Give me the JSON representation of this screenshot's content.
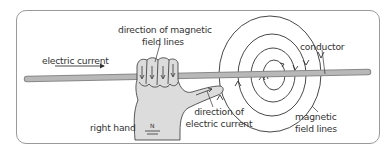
{
  "diagram": {
    "labels": {
      "electric_current": "electric current",
      "direction_field_line1": "direction of magnetic",
      "direction_field_line2": "field lines",
      "right_hand": "right hand",
      "direction_current_line1": "direction of",
      "direction_current_line2": "electric current",
      "conductor": "conductor",
      "magnetic_line1": "magnetic",
      "magnetic_line2": "field lines",
      "wrist_mark_top": "N",
      "wrist_mark_bottom": "I"
    },
    "colors": {
      "rod": "#b0b0b0",
      "rod_edge": "#888888",
      "hand_fill": "#dcdcdc",
      "lines": "#333333",
      "frame": "#9a9a9a"
    }
  }
}
